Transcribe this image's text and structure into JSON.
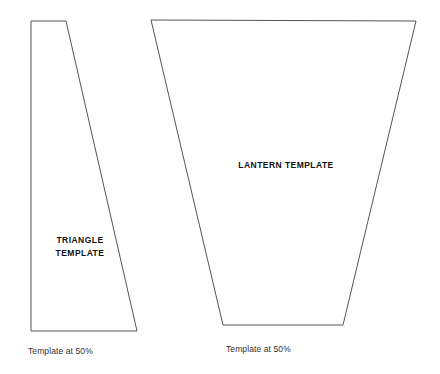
{
  "page": {
    "background_color": "#ffffff",
    "stroke_color": "#555555",
    "text_color": "#111111",
    "caption_color": "#333333",
    "width": 440,
    "height": 374
  },
  "shapes": [
    {
      "name": "triangle-template",
      "label": "TRIANGLE\nTEMPLATE",
      "caption": "Template at 50%",
      "points": "31,21 66,21 137,331 31,331",
      "label_x": 80,
      "label_y": 247,
      "caption_x": 28,
      "caption_y": 346
    },
    {
      "name": "lantern-template",
      "label": "LANTERN TEMPLATE",
      "caption": "Template at 50%",
      "points": "151,20 416,21 343,325 223,325",
      "label_x": 286,
      "label_y": 165,
      "caption_x": 226,
      "caption_y": 344
    }
  ],
  "labels": {
    "triangle": "TRIANGLE\nTEMPLATE",
    "lantern": "LANTERN TEMPLATE"
  },
  "captions": {
    "triangle": "Template at 50%",
    "lantern": "Template at 50%"
  }
}
